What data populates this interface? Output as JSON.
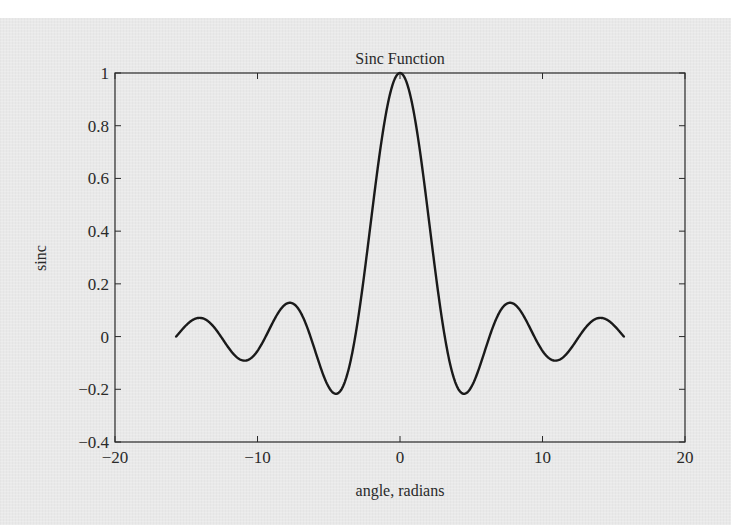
{
  "chart_data": {
    "type": "line",
    "title": "Sinc Function",
    "xlabel": "angle, radians",
    "ylabel": "sinc",
    "xlim": [
      -20,
      20
    ],
    "ylim": [
      -0.4,
      1
    ],
    "xticks": [
      -20,
      -10,
      0,
      10,
      20
    ],
    "xtick_labels": [
      "−20",
      "−10",
      "0",
      "10",
      "20"
    ],
    "yticks": [
      -0.4,
      -0.2,
      0,
      0.2,
      0.4,
      0.6,
      0.8,
      1
    ],
    "ytick_labels": [
      "−0.4",
      "−0.2",
      "0",
      "0.2",
      "0.4",
      "0.6",
      "0.8",
      "1"
    ],
    "grid": false,
    "legend": "none",
    "series": [
      {
        "name": "sinc",
        "function": "sin(x)/x",
        "x_range": [
          -15.708,
          15.708
        ],
        "color": "#1a1a1a",
        "x": [
          -15.708,
          -14.137,
          -12.566,
          -10.996,
          -9.425,
          -7.854,
          -6.283,
          -4.712,
          -3.142,
          -1.571,
          0,
          1.571,
          3.142,
          4.712,
          6.283,
          7.854,
          9.425,
          10.996,
          12.566,
          14.137,
          15.708
        ],
        "y": [
          0.0,
          0.0707,
          0.0,
          -0.0909,
          0.0,
          0.1273,
          0.0,
          -0.2122,
          0.0,
          0.6366,
          1.0,
          0.6366,
          0.0,
          -0.2122,
          0.0,
          0.1273,
          0.0,
          -0.0909,
          0.0,
          0.0707,
          0.0
        ]
      }
    ]
  },
  "colors": {
    "background": "#e9e9e9",
    "axes": "#2a2a2a",
    "line": "#1a1a1a"
  }
}
